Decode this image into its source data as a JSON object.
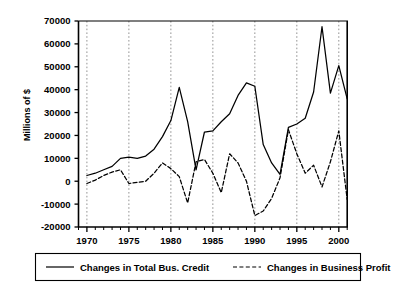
{
  "chart_data": {
    "type": "line",
    "title": "",
    "subtitle": "",
    "xlabel": "",
    "ylabel": "Millions of $",
    "xlim": [
      1969,
      2001
    ],
    "ylim": [
      -20000,
      70000
    ],
    "grid": "vertical dotted gridlines at 1970, 1975, 1980, 1985, 1990, 1995, 2000",
    "legend_position": "bottom",
    "x_tick_labels": [
      "1970",
      "1975",
      "1980",
      "1985",
      "1990",
      "1995",
      "2000"
    ],
    "x_tick_values": [
      1970,
      1975,
      1980,
      1985,
      1990,
      1995,
      2000
    ],
    "x_minor_tick_interval": 1,
    "y_tick_labels": [
      "70000",
      "60000",
      "50000",
      "40000",
      "30000",
      "20000",
      "10000",
      "0",
      "-10000",
      "-20000"
    ],
    "y_tick_values": [
      70000,
      60000,
      50000,
      40000,
      30000,
      20000,
      10000,
      0,
      -10000,
      -20000
    ],
    "x": [
      1970,
      1971,
      1972,
      1973,
      1974,
      1975,
      1976,
      1977,
      1978,
      1979,
      1980,
      1981,
      1982,
      1983,
      1984,
      1985,
      1986,
      1987,
      1988,
      1989,
      1990,
      1991,
      1992,
      1993,
      1994,
      1995,
      1996,
      1997,
      1998,
      1999,
      2000,
      2001
    ],
    "series": [
      {
        "name": "Changes in Total Bus. Credit",
        "style": "solid",
        "color": "#000000",
        "values": [
          2500,
          3500,
          5000,
          6500,
          10000,
          10500,
          10000,
          11000,
          14000,
          19500,
          26500,
          41000,
          26000,
          5000,
          21500,
          22000,
          26000,
          29500,
          37500,
          43000,
          41500,
          16000,
          8000,
          3000,
          23500,
          25000,
          27500,
          39000,
          67500,
          38500,
          50500,
          36000
        ]
      },
      {
        "name": "Changes in Business Profit",
        "style": "dashed",
        "color": "#000000",
        "values": [
          -1000,
          500,
          2500,
          4000,
          5000,
          -1000,
          -500,
          0,
          3500,
          8000,
          5500,
          2000,
          -9500,
          8500,
          9500,
          3500,
          -5000,
          12000,
          8000,
          0,
          -15000,
          -13000,
          -7500,
          1500,
          22500,
          12000,
          3500,
          7000,
          -2500,
          8500,
          22000,
          -8000
        ]
      }
    ],
    "annotations": {
      "credit_peak_1981": 41000,
      "credit_peak_1989": 43000,
      "credit_peak_1998": 67500,
      "credit_peak_2000": 50500,
      "profit_trough_1982": -9500,
      "profit_trough_1990": -15000,
      "profit_peak_1994": 22500,
      "profit_peak_2000": 22000
    }
  },
  "legend": {
    "items": [
      {
        "label": "Changes in Total Bus. Credit",
        "style": "solid"
      },
      {
        "label": "Changes in Business Profit",
        "style": "dashed"
      }
    ]
  }
}
